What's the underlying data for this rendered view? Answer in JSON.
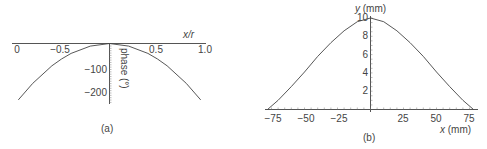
{
  "chart_data": [
    {
      "type": "line",
      "panel": "(a)",
      "title": "",
      "xlabel": "x/r",
      "ylabel": "phase (°)",
      "x_ticks": [
        "0",
        "−0.5",
        "0.5",
        "1.0"
      ],
      "y_ticks": [
        "−100",
        "−200"
      ],
      "xlim": [
        -1.0,
        1.0
      ],
      "ylim": [
        -250,
        0
      ],
      "grid": false,
      "series": [
        {
          "name": "phase",
          "x": [
            -0.95,
            -0.8,
            -0.6,
            -0.5,
            -0.4,
            -0.2,
            0,
            0.2,
            0.4,
            0.5,
            0.6,
            0.8,
            0.95
          ],
          "y": [
            -240,
            -170,
            -95,
            -66,
            -42,
            -11,
            0,
            -11,
            -42,
            -66,
            -95,
            -170,
            -240
          ]
        }
      ]
    },
    {
      "type": "line",
      "panel": "(b)",
      "title": "",
      "xlabel": "x (mm)",
      "ylabel": "y (mm)",
      "x_ticks": [
        "−75",
        "−50",
        "−25",
        "25",
        "50",
        "75"
      ],
      "y_ticks": [
        "2",
        "4",
        "6",
        "8",
        "10"
      ],
      "xlim": [
        -80,
        80
      ],
      "ylim": [
        0,
        10
      ],
      "grid": false,
      "series": [
        {
          "name": "profile",
          "x": [
            -78,
            -70,
            -60,
            -50,
            -40,
            -30,
            -20,
            -10,
            0,
            10,
            20,
            30,
            40,
            50,
            60,
            70,
            78
          ],
          "y": [
            0,
            1.0,
            2.5,
            4.1,
            5.8,
            7.3,
            8.6,
            9.6,
            10,
            9.6,
            8.6,
            7.3,
            5.8,
            4.1,
            2.5,
            1.0,
            0
          ]
        }
      ]
    }
  ],
  "captions": {
    "a": "(a)",
    "b": "(b)"
  },
  "panel_a": {
    "xlabel": "x/r",
    "ylabel": "phase (°)",
    "x_ticks": [
      {
        "label": "0",
        "x": 17
      },
      {
        "label": "−0.5",
        "x": 60
      },
      {
        "label": "0.5",
        "x": 156
      },
      {
        "label": "1.0",
        "x": 205
      }
    ],
    "y_ticks": [
      {
        "label": "−100",
        "y": 73
      },
      {
        "label": "−200",
        "y": 96
      }
    ]
  },
  "panel_b": {
    "xlabel": "x (mm)",
    "ylabel": "y (mm)",
    "x_ticks": [
      {
        "label": "−75",
        "x": 273
      },
      {
        "label": "−50",
        "x": 306
      },
      {
        "label": "−25",
        "x": 339
      },
      {
        "label": "25",
        "x": 403
      },
      {
        "label": "50",
        "x": 436
      },
      {
        "label": "75",
        "x": 469
      }
    ],
    "y_ticks": [
      {
        "label": "10",
        "y": 21
      },
      {
        "label": "8",
        "y": 39
      },
      {
        "label": "6",
        "y": 58
      },
      {
        "label": "4",
        "y": 76
      },
      {
        "label": "2",
        "y": 94
      }
    ]
  }
}
